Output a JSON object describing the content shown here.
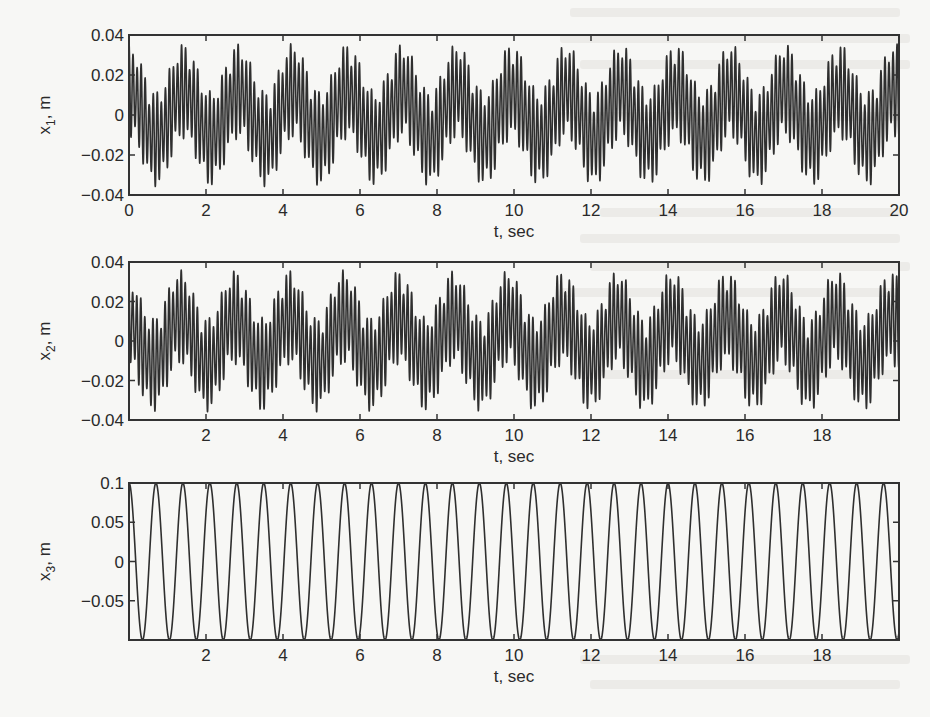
{
  "figure": {
    "panels": [
      {
        "id": "x1",
        "ylabel": "x",
        "ylabel_sub": "1",
        "ylabel_unit": ", m",
        "xlabel": "t, sec",
        "xlim": [
          0,
          20
        ],
        "ylim": [
          -0.04,
          0.04
        ],
        "xticks": [
          0,
          2,
          4,
          6,
          8,
          10,
          12,
          14,
          16,
          18,
          20
        ],
        "xtick_labels": [
          "0",
          "2",
          "4",
          "6",
          "8",
          "10",
          "12",
          "14",
          "16",
          "18",
          "20"
        ],
        "yticks": [
          0.04,
          0.02,
          0,
          -0.02,
          -0.04
        ],
        "ytick_labels": [
          "0.04",
          "0.02",
          "0",
          "−0.02",
          "−0.04"
        ]
      },
      {
        "id": "x2",
        "ylabel": "x",
        "ylabel_sub": "2",
        "ylabel_unit": ", m",
        "xlabel": "t, sec",
        "xlim": [
          0,
          20
        ],
        "ylim": [
          -0.04,
          0.04
        ],
        "xticks": [
          2,
          4,
          6,
          8,
          10,
          12,
          14,
          16,
          18
        ],
        "xtick_labels": [
          "2",
          "4",
          "6",
          "8",
          "10",
          "12",
          "14",
          "16",
          "18"
        ],
        "yticks": [
          0.04,
          0.02,
          0,
          -0.02,
          -0.04
        ],
        "ytick_labels": [
          "0.04",
          "0.02",
          "0",
          "−0.02",
          "−0.04"
        ]
      },
      {
        "id": "x3",
        "ylabel": "x",
        "ylabel_sub": "3",
        "ylabel_unit": ", m",
        "xlabel": "t, sec",
        "xlim": [
          0,
          20
        ],
        "ylim": [
          -0.1,
          0.1
        ],
        "xticks": [
          2,
          4,
          6,
          8,
          10,
          12,
          14,
          16,
          18
        ],
        "xtick_labels": [
          "2",
          "4",
          "6",
          "8",
          "10",
          "12",
          "14",
          "16",
          "18"
        ],
        "yticks": [
          0.1,
          0.05,
          0,
          -0.05
        ],
        "ytick_labels": [
          "0.1",
          "0.05",
          "0",
          "−0.05"
        ]
      }
    ]
  },
  "chart_data": [
    {
      "type": "line",
      "title": "",
      "xlabel": "t, sec",
      "ylabel": "x1, m",
      "xlim": [
        0,
        20
      ],
      "ylim": [
        -0.04,
        0.04
      ],
      "grid": false,
      "legend": null,
      "description": "Multi-frequency oscillation: slow component (~1.4 s period, ~0.012 m) plus fast component (~0.1 s period, ~0.025 m); peaks reach about ±0.04 m",
      "model": {
        "slow_amp": 0.012,
        "slow_period": 1.42,
        "fast_amp": 0.024,
        "fast_period": 0.105,
        "mod_period": 0.7,
        "phase": 0.0
      },
      "x": [
        0,
        0.5,
        1,
        1.5,
        2,
        2.5,
        3,
        3.5,
        4,
        4.5,
        5
      ],
      "values": [
        0.035,
        -0.02,
        -0.03,
        0.03,
        0.04,
        -0.025,
        -0.035,
        0.035,
        0.03,
        -0.03,
        -0.035
      ]
    },
    {
      "type": "line",
      "title": "",
      "xlabel": "t, sec",
      "ylabel": "x2, m",
      "xlim": [
        0,
        20
      ],
      "ylim": [
        -0.04,
        0.04
      ],
      "grid": false,
      "legend": null,
      "description": "Similar multi-frequency oscillation to x1 with slightly different phase; amplitude about ±0.04 m",
      "model": {
        "slow_amp": 0.012,
        "slow_period": 1.42,
        "fast_amp": 0.024,
        "fast_period": 0.105,
        "mod_period": 0.7,
        "phase": 0.4
      },
      "x": [
        0,
        0.5,
        1,
        1.5,
        2,
        2.5,
        3,
        3.5,
        4,
        4.5,
        5
      ],
      "values": [
        0.03,
        -0.03,
        -0.035,
        0.035,
        0.04,
        -0.03,
        -0.035,
        0.035,
        0.035,
        -0.03,
        -0.035
      ]
    },
    {
      "type": "line",
      "title": "",
      "xlabel": "t, sec",
      "ylabel": "x3, m",
      "xlim": [
        0,
        20
      ],
      "ylim": [
        -0.1,
        0.1
      ],
      "grid": false,
      "legend": null,
      "description": "Pure sinusoid x3 = 0.1 cos(2π t / 0.70), about 28.6 cycles over 20 s",
      "model": {
        "amp": 0.1,
        "period": 0.7
      },
      "x": [
        0,
        0.35,
        0.7,
        1.05,
        1.4,
        1.75,
        2.1
      ],
      "values": [
        0.1,
        -0.1,
        0.1,
        -0.1,
        0.1,
        -0.1,
        0.1
      ]
    }
  ]
}
